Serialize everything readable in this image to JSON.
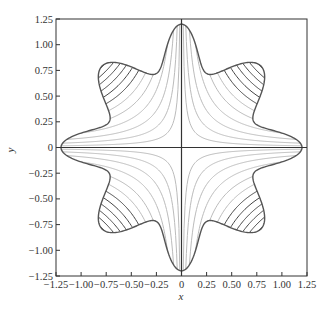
{
  "chart_data": {
    "type": "line",
    "title": "",
    "xlabel": "x",
    "ylabel": "y",
    "xlim": [
      -1.25,
      1.25
    ],
    "ylim": [
      -1.25,
      1.25
    ],
    "grid": false,
    "legend": null,
    "x_ticks": [
      "-1.25",
      "-1.00",
      "-0.75",
      "-0.50",
      "-0.25",
      "0",
      "0.25",
      "0.50",
      "0.75",
      "1.00",
      "1.25"
    ],
    "y_ticks": [
      "1.25",
      "1.00",
      "0.75",
      "0.50",
      "0.25",
      "0",
      "-0.25",
      "-0.50",
      "-0.75",
      "-1.00",
      "-1.25"
    ],
    "x_tick_values": [
      -1.25,
      -1.0,
      -0.75,
      -0.5,
      -0.25,
      0,
      0.25,
      0.5,
      0.75,
      1.0,
      1.25
    ],
    "y_tick_values": [
      1.25,
      1.0,
      0.75,
      0.5,
      0.25,
      0,
      -0.25,
      -0.5,
      -0.75,
      -1.0,
      -1.25
    ],
    "boundary": {
      "description": "closed six-lobed star curve; lobes on +/-x and +/-y axes reaching ~1.2, diagonal lobes near (+/-0.75, +/-0.8)",
      "axis_lobe_radius": 1.2,
      "diagonal_lobe_center": [
        0.8,
        0.78
      ],
      "color": "#555555"
    },
    "contours": {
      "description": "hyperbolic level curves x*y = c inside boundary, symmetric in all quadrants",
      "levels": [
        0.02,
        0.05,
        0.09,
        0.14,
        0.2,
        0.26,
        0.32,
        0.38,
        0.44,
        0.5,
        0.56,
        0.62
      ],
      "light_color": "#bbbbbb",
      "dark_color": "#444444",
      "dark_threshold": 0.3
    },
    "axes_lines": {
      "x0": true,
      "y0": true,
      "color": "#333333"
    }
  }
}
